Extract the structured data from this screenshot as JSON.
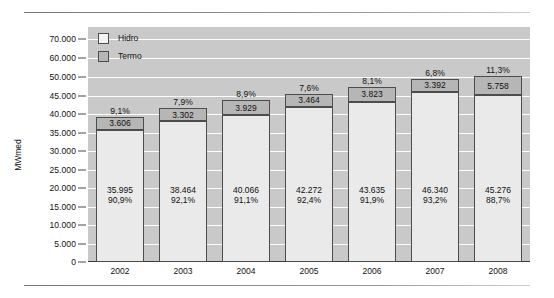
{
  "chart_data": {
    "type": "bar",
    "subtype": "stacked-bar",
    "title": "",
    "xlabel": "",
    "ylabel": "MWmed",
    "categories": [
      "2002",
      "2003",
      "2004",
      "2005",
      "2006",
      "2007",
      "2008"
    ],
    "ytick_labels": [
      "0",
      "5.000",
      "10.000",
      "15.000",
      "20.000",
      "25.000",
      "30.000",
      "35.000",
      "40.000",
      "45.000",
      "50.000",
      "60.000",
      "70.000"
    ],
    "ytick_values": [
      0,
      5000,
      10000,
      15000,
      20000,
      25000,
      30000,
      35000,
      40000,
      45000,
      50000,
      60000,
      70000
    ],
    "ylim": [
      0,
      70000
    ],
    "axis_note": "broken / non-linear axis: 5.000 steps up to 50.000, then 10.000 steps",
    "grid": true,
    "legend_position": "top-left",
    "series": [
      {
        "name": "Hidro",
        "color": "#eaeaea",
        "values": [
          35995,
          38464,
          40066,
          42272,
          43635,
          46340,
          45276
        ],
        "value_labels": [
          "35.995",
          "38.464",
          "40.066",
          "42.272",
          "43.635",
          "46.340",
          "45.276"
        ],
        "pct_labels": [
          "90,9%",
          "92,1%",
          "91,1%",
          "92,4%",
          "91,9%",
          "93,2%",
          "88,7%"
        ]
      },
      {
        "name": "Termo",
        "color": "#b6b6b6",
        "values": [
          3606,
          3302,
          3929,
          3464,
          3823,
          3392,
          5758
        ],
        "value_labels": [
          "3.606",
          "3.302",
          "3.929",
          "3.464",
          "3.823",
          "3.392",
          "5.758"
        ],
        "pct_labels": [
          "9,1%",
          "7,9%",
          "8,9%",
          "7,6%",
          "8,1%",
          "6,8%",
          "11,3%"
        ]
      }
    ],
    "totals": [
      39601,
      41766,
      43995,
      45736,
      47458,
      49732,
      51034
    ]
  },
  "legend": {
    "items": [
      {
        "label": "Hidro",
        "swatch": "hidro-swatch"
      },
      {
        "label": "Termo",
        "swatch": "termo-swatch"
      }
    ]
  }
}
